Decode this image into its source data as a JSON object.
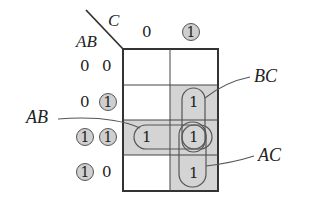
{
  "diagram": {
    "type": "karnaugh-map",
    "variables": {
      "row_label": "AB",
      "col_label": "C"
    },
    "column_headers": [
      {
        "value": "0",
        "highlighted": false
      },
      {
        "value": "1",
        "highlighted": true
      }
    ],
    "row_headers": [
      {
        "a": "0",
        "b": "0",
        "a_highlighted": false,
        "b_highlighted": false
      },
      {
        "a": "0",
        "b": "1",
        "a_highlighted": false,
        "b_highlighted": true
      },
      {
        "a": "1",
        "b": "1",
        "a_highlighted": true,
        "b_highlighted": true
      },
      {
        "a": "1",
        "b": "0",
        "a_highlighted": true,
        "b_highlighted": false
      }
    ],
    "cells": [
      [
        "",
        ""
      ],
      [
        "",
        "1"
      ],
      [
        "1",
        "1"
      ],
      [
        "",
        "1"
      ]
    ],
    "groups": [
      {
        "label": "BC",
        "cells": "rows 01,11 at C=1"
      },
      {
        "label": "AB",
        "cells": "row 11, C=0 and C=1"
      },
      {
        "label": "AC",
        "cells": "rows 11,10 at C=1"
      }
    ],
    "colors": {
      "shade": "#d4d4d4",
      "line": "#333333",
      "circle_fill": "#cfcfcf"
    }
  }
}
